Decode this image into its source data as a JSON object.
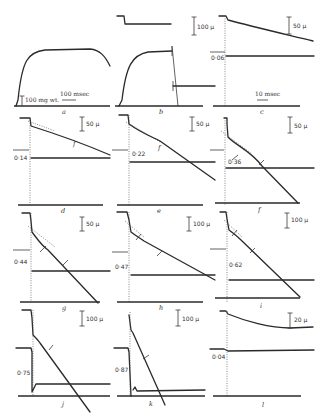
{
  "figure": {
    "panel_labels": [
      "a",
      "b",
      "c",
      "d",
      "e",
      "f",
      "g",
      "h",
      "i",
      "j",
      "k",
      "l"
    ],
    "scale_bars": {
      "a_force": "100 mg wt.",
      "a_time": "100 msec",
      "b_length": "100 μ",
      "c_length": "50 μ",
      "c_time": "10 msec",
      "d_length": "50 μ",
      "e_length": "50 μ",
      "f_length": "50 μ",
      "g_length": "50 μ",
      "h_length": "100 μ",
      "i_length": "100 μ",
      "j_length": "100 μ",
      "k_length": "100 μ",
      "l_length": "20 μ"
    },
    "load_values": {
      "c": "0·06",
      "d": "0·14",
      "e": "0·22",
      "f": "0·36",
      "g": "0·44",
      "h": "0·47",
      "i": "0·62",
      "j": "0·75",
      "k": "0·87",
      "l": "0·04"
    },
    "marker_label": "f"
  }
}
